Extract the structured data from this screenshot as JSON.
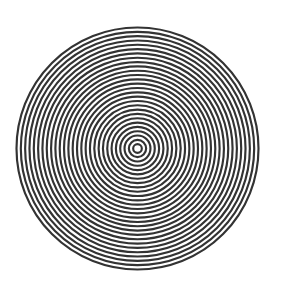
{
  "figure": {
    "center": [
      137.5,
      148.5
    ],
    "outer_radius": 121,
    "ring_count": 28,
    "line_color": "#333333",
    "background_color": "#ffffff"
  }
}
